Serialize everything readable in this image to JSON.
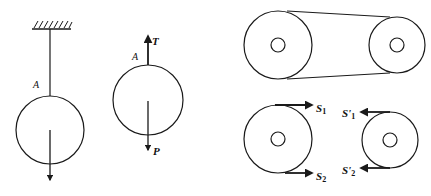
{
  "figures": {
    "suspended_ball": {
      "rope_label": "A"
    },
    "free_body": {
      "point_label": "A",
      "tension_label": "T",
      "weight_label": "P"
    },
    "belt_drive": {
      "description": "two pulleys connected by a belt"
    },
    "belt_forces": {
      "left_pulley": {
        "top_force": {
          "main": "S",
          "sub": "1"
        },
        "bottom_force": {
          "main": "S",
          "sub": "2"
        }
      },
      "right_pulley": {
        "top_force": {
          "main": "S'",
          "sub": "1"
        },
        "bottom_force": {
          "main": "S'",
          "sub": "2"
        }
      }
    }
  },
  "colors": {
    "stroke": "#1a1a1a",
    "background": "#ffffff"
  }
}
